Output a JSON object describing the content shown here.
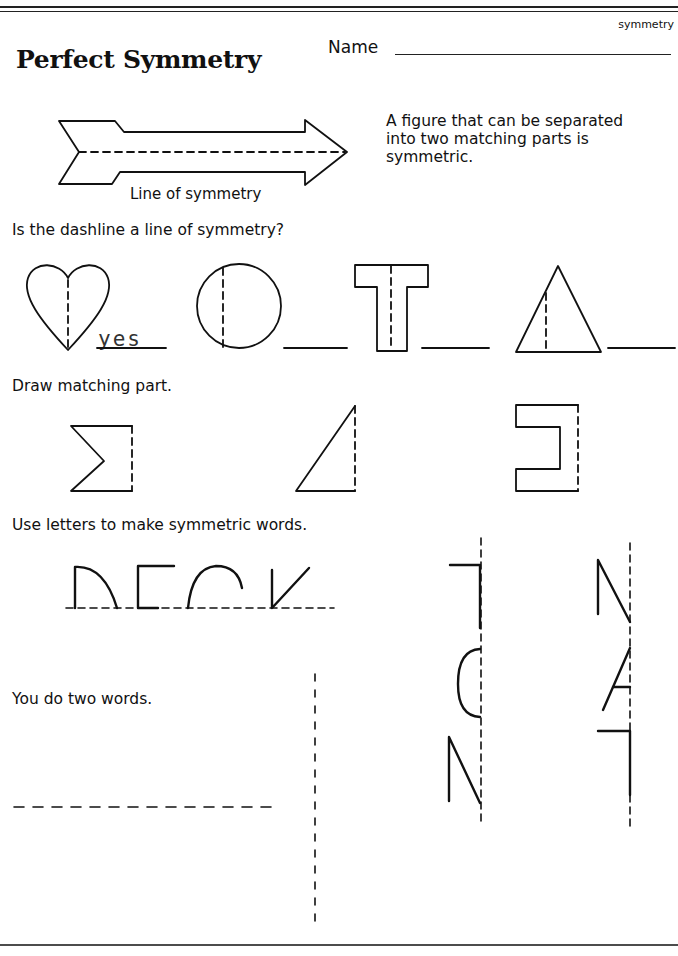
{
  "header": {
    "topic_tag": "symmetry",
    "name_label": "Name",
    "title": "Perfect Symmetry"
  },
  "intro": {
    "figure_caption": "Line of symmetry",
    "definition": "A figure that can be separated into two matching parts is symmetric."
  },
  "section1": {
    "prompt": "Is the dashline a line of symmetry?",
    "items": [
      {
        "shape": "heart",
        "answer": "yes"
      },
      {
        "shape": "circle",
        "answer": ""
      },
      {
        "shape": "letter-T",
        "answer": ""
      },
      {
        "shape": "triangle",
        "answer": ""
      }
    ]
  },
  "section2": {
    "prompt": "Draw matching part.",
    "items": [
      {
        "shape": "sigma-half"
      },
      {
        "shape": "right-triangle-half"
      },
      {
        "shape": "bracket-half"
      }
    ]
  },
  "section3": {
    "prompt": "Use letters to make symmetric words.",
    "example_word": "DECK (top halves)",
    "vertical_examples": [
      "TOM (left halves)",
      "MAT (right halves)"
    ]
  },
  "section4": {
    "prompt": "You do two words."
  }
}
